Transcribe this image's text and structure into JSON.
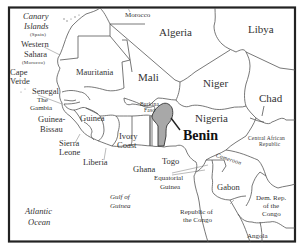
{
  "map": {
    "title": "West Africa",
    "highlighted_country": "Benin",
    "colors": {
      "background": "#ffffff",
      "border": "#222222",
      "country_lines": "#555555",
      "highlight_fill": "#a8a8a8",
      "label_text": "#333333"
    },
    "labels": {
      "canary": "Canary",
      "islands": "Islands",
      "spain": "(Spain)",
      "morocco": "Morocco",
      "algeria": "Algeria",
      "libya": "Libya",
      "western": "Western",
      "sahara": "Sahara",
      "morocco_paren": "(Morocco)",
      "mauritania": "Mauritania",
      "mali": "Mali",
      "niger": "Niger",
      "chad": "Chad",
      "cape": "Cape",
      "verde": "Verde",
      "senegal": "Senegal",
      "the": "The",
      "gambia": "Gambia",
      "guinea_bissau_1": "Guinea-",
      "guinea_bissau_2": "Bissau",
      "guinea": "Guinea",
      "burkina": "Burkina",
      "faso": "Faso",
      "benin": "Benin",
      "nigeria": "Nigeria",
      "sierra": "Sierra",
      "leone": "Leone",
      "ivory": "Ivory",
      "coast": "Coast",
      "liberia": "Liberia",
      "ghana": "Ghana",
      "togo": "Togo",
      "cameroon": "Cameroon",
      "car_1": "Central African",
      "car_2": "Republic",
      "equatorial": "Equatorial",
      "eq_guinea": "Guinea",
      "gabon": "Gabon",
      "gulf_of": "Gulf of",
      "gulf_guinea": "Guinea",
      "atlantic": "Atlantic",
      "ocean": "Ocean",
      "roc_1": "Republic of",
      "roc_2": "the Congo",
      "drc_1": "Dem. Rep.",
      "drc_2": "of the",
      "drc_3": "Congo",
      "angola": "Angola"
    }
  }
}
